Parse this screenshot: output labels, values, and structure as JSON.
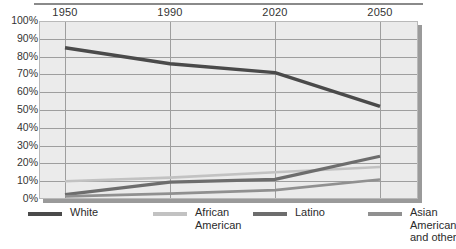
{
  "chart_data": {
    "type": "line",
    "title": "",
    "xlabel": "",
    "ylabel": "",
    "x": [
      1950,
      1990,
      2020,
      2050
    ],
    "xticklabels": [
      "1950",
      "1990",
      "2020",
      "2050"
    ],
    "yticklabels": [
      "100%",
      "90%",
      "80%",
      "70%",
      "60%",
      "50%",
      "40%",
      "30%",
      "20%",
      "10%",
      "0%"
    ],
    "ylim": [
      0,
      100
    ],
    "ytick_step": 10,
    "grid": true,
    "legend_position": "bottom",
    "series": [
      {
        "name": "White",
        "values": [
          85,
          76,
          71,
          52
        ],
        "color": "#4a4a4a",
        "width": 3.4
      },
      {
        "name": "African\nAmerican",
        "values": [
          10,
          12,
          15,
          18
        ],
        "color": "#c2c2c2",
        "width": 2.6
      },
      {
        "name": "Latino",
        "values": [
          2.5,
          9.5,
          11,
          24
        ],
        "color": "#6d6d6d",
        "width": 3.2
      },
      {
        "name": "Asian\nAmerican\nand other",
        "values": [
          1.5,
          3,
          5,
          11
        ],
        "color": "#909090",
        "width": 2.6
      }
    ]
  },
  "axis": {
    "x_ticks": [
      {
        "label": "1950"
      },
      {
        "label": "1990"
      },
      {
        "label": "2020"
      },
      {
        "label": "2050"
      }
    ],
    "y_ticks": [
      {
        "label": "100%"
      },
      {
        "label": "90%"
      },
      {
        "label": "80%"
      },
      {
        "label": "70%"
      },
      {
        "label": "60%"
      },
      {
        "label": "50%"
      },
      {
        "label": "40%"
      },
      {
        "label": "30%"
      },
      {
        "label": "20%"
      },
      {
        "label": "10%"
      },
      {
        "label": "0%"
      }
    ]
  },
  "legend": {
    "items": [
      {
        "label": "White",
        "color": "#4a4a4a"
      },
      {
        "label": "African\nAmerican",
        "color": "#c2c2c2"
      },
      {
        "label": "Latino",
        "color": "#6d6d6d"
      },
      {
        "label": "Asian\nAmerican\nand other",
        "color": "#909090"
      }
    ]
  },
  "colors": {
    "plot_background": "#ebebeb",
    "gridline": "#9e9e9e",
    "shadow": "#9a9a9a",
    "text": "#2b2b2b"
  }
}
